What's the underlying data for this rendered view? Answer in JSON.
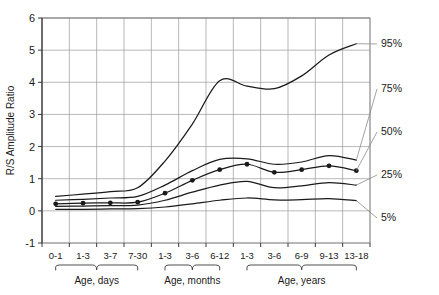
{
  "chart_data": {
    "type": "line",
    "title": "",
    "xlabel": "",
    "ylabel": "R/S Amplitude Ratio",
    "ylim": [
      -1,
      6
    ],
    "ytick_labels": [
      "6",
      "5",
      "4",
      "3",
      "2",
      "1",
      "0",
      "-1"
    ],
    "ytick_values": [
      6,
      5,
      4,
      3,
      2,
      1,
      0,
      -1
    ],
    "grid": true,
    "legend_position": "right-inline-leader-labels",
    "categories": [
      "0-1",
      "1-3",
      "3-7",
      "7-30",
      "1-3",
      "3-6",
      "6-12",
      "1-3",
      "3-6",
      "6-9",
      "9-13",
      "13-18"
    ],
    "x_groups": [
      {
        "label": "Age, days",
        "categories": [
          "0-1",
          "1-3",
          "3-7",
          "7-30"
        ]
      },
      {
        "label": "Age, months",
        "categories": [
          "1-3",
          "3-6",
          "6-12"
        ]
      },
      {
        "label": "Age, years",
        "categories": [
          "1-3",
          "3-6",
          "6-9",
          "9-13",
          "13-18"
        ]
      }
    ],
    "series": [
      {
        "name": "95%",
        "label": "95%",
        "markers": false,
        "values": [
          0.45,
          0.52,
          0.6,
          0.72,
          1.55,
          2.7,
          4.05,
          3.88,
          3.8,
          4.2,
          4.85,
          5.2
        ]
      },
      {
        "name": "75%",
        "label": "75%",
        "markers": false,
        "values": [
          0.33,
          0.36,
          0.4,
          0.45,
          0.8,
          1.25,
          1.6,
          1.62,
          1.45,
          1.52,
          1.72,
          1.58
        ]
      },
      {
        "name": "50%",
        "label": "50%",
        "markers": true,
        "values": [
          0.22,
          0.24,
          0.25,
          0.27,
          0.55,
          0.95,
          1.28,
          1.45,
          1.2,
          1.28,
          1.4,
          1.25
        ]
      },
      {
        "name": "25%",
        "label": "25%",
        "markers": false,
        "values": [
          0.14,
          0.15,
          0.16,
          0.18,
          0.33,
          0.58,
          0.8,
          0.92,
          0.72,
          0.78,
          0.88,
          0.8
        ]
      },
      {
        "name": "5%",
        "label": "5%",
        "markers": false,
        "values": [
          0.05,
          0.05,
          0.06,
          0.07,
          0.12,
          0.22,
          0.33,
          0.4,
          0.34,
          0.35,
          0.38,
          0.32
        ]
      }
    ],
    "marker_series_name": "50%",
    "marker_points": [
      {
        "category": "0-1",
        "value": 0.22
      },
      {
        "category": "1-3",
        "value": 0.24
      },
      {
        "category": "3-7",
        "value": 0.25
      },
      {
        "category": "7-30",
        "value": 0.27
      },
      {
        "category": "1-3",
        "value": 0.55
      },
      {
        "category": "3-6",
        "value": 0.95
      },
      {
        "category": "6-12",
        "value": 1.28
      },
      {
        "category": "1-3",
        "value": 1.45
      },
      {
        "category": "3-6",
        "value": 1.2
      },
      {
        "category": "6-9",
        "value": 1.28
      },
      {
        "category": "9-13",
        "value": 1.4
      },
      {
        "category": "13-18",
        "value": 1.25
      }
    ],
    "colors": {
      "line": "#1a1a1a",
      "grid": "#9a9a9a",
      "frame": "#7d7d7d",
      "text": "#1a1a1a",
      "leader": "#8c8c8c",
      "background": "#ffffff"
    }
  }
}
